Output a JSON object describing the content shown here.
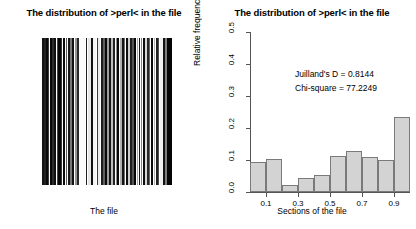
{
  "left_panel": {
    "title": "The distribution of >perl< in the file",
    "xlabel": "The file"
  },
  "right_panel": {
    "title": "The distribution of >perl< in the file",
    "annotations": {
      "juilland_d": "Juilland's D = 0.8144",
      "chi_square": "Chi-square = 77.2249"
    }
  },
  "chart_data": {
    "type": "bar",
    "title": "The distribution of >perl< in the file",
    "xlabel": "Sections of the file",
    "ylabel": "Relative frequencies of 'perl'",
    "categories": [
      "0.05",
      "0.15",
      "0.25",
      "0.35",
      "0.45",
      "0.55",
      "0.65",
      "0.75",
      "0.85",
      "0.95"
    ],
    "values": [
      0.093,
      0.102,
      0.022,
      0.045,
      0.054,
      0.113,
      0.128,
      0.108,
      0.101,
      0.235
    ],
    "bin_edges": [
      0.0,
      0.1,
      0.2,
      0.3,
      0.4,
      0.5,
      0.6,
      0.7,
      0.8,
      0.9,
      1.0
    ],
    "xlim": [
      0.0,
      1.0
    ],
    "ylim": [
      0.0,
      0.5
    ],
    "xticks": [
      "0.1",
      "0.3",
      "0.5",
      "0.7",
      "0.9"
    ],
    "xtick_values": [
      0.1,
      0.3,
      0.5,
      0.7,
      0.9
    ],
    "yticks": [
      "0.0",
      "0.1",
      "0.2",
      "0.3",
      "0.4",
      "0.5"
    ],
    "ytick_values": [
      0.0,
      0.1,
      0.2,
      0.3,
      0.4,
      0.5
    ],
    "grid": false,
    "legend": "none",
    "bar_fill": "#d3d3d3",
    "bar_stroke": "#7a7a7a"
  },
  "barcode_data": {
    "type": "rug-strip",
    "description": "dispersion barcode of token positions across the file",
    "lines": [
      {
        "pos": 0.5,
        "w": 2.0,
        "v": 20
      },
      {
        "pos": 2.0,
        "w": 1.6,
        "v": 35
      },
      {
        "pos": 3.6,
        "w": 2.2,
        "v": 10
      },
      {
        "pos": 6.0,
        "w": 1.4,
        "v": 60
      },
      {
        "pos": 7.6,
        "w": 2.4,
        "v": 8
      },
      {
        "pos": 10.4,
        "w": 1.6,
        "v": 45
      },
      {
        "pos": 12.3,
        "w": 2.0,
        "v": 15
      },
      {
        "pos": 14.6,
        "w": 1.5,
        "v": 70
      },
      {
        "pos": 16.4,
        "w": 2.2,
        "v": 5
      },
      {
        "pos": 19.0,
        "w": 1.4,
        "v": 55
      },
      {
        "pos": 20.8,
        "w": 2.6,
        "v": 12
      },
      {
        "pos": 23.8,
        "w": 1.6,
        "v": 90
      },
      {
        "pos": 25.8,
        "w": 2.0,
        "v": 25
      },
      {
        "pos": 28.2,
        "w": 1.4,
        "v": 120
      },
      {
        "pos": 30.0,
        "w": 2.4,
        "v": 18
      },
      {
        "pos": 33.0,
        "w": 1.5,
        "v": 150
      },
      {
        "pos": 35.0,
        "w": 2.0,
        "v": 40
      },
      {
        "pos": 37.5,
        "w": 5.5,
        "v": 250
      },
      {
        "pos": 43.5,
        "w": 1.8,
        "v": 30
      },
      {
        "pos": 45.8,
        "w": 3.0,
        "v": 230
      },
      {
        "pos": 49.3,
        "w": 1.6,
        "v": 15
      },
      {
        "pos": 51.3,
        "w": 2.6,
        "v": 245
      },
      {
        "pos": 54.5,
        "w": 1.4,
        "v": 60
      },
      {
        "pos": 56.4,
        "w": 2.0,
        "v": 235
      },
      {
        "pos": 59.0,
        "w": 1.6,
        "v": 28
      },
      {
        "pos": 61.0,
        "w": 1.5,
        "v": 95
      },
      {
        "pos": 63.0,
        "w": 1.8,
        "v": 10
      },
      {
        "pos": 65.2,
        "w": 1.4,
        "v": 160
      },
      {
        "pos": 67.0,
        "w": 2.0,
        "v": 22
      },
      {
        "pos": 69.4,
        "w": 1.5,
        "v": 190
      },
      {
        "pos": 71.3,
        "w": 1.8,
        "v": 35
      },
      {
        "pos": 73.5,
        "w": 1.4,
        "v": 140
      },
      {
        "pos": 75.3,
        "w": 2.2,
        "v": 8
      },
      {
        "pos": 78.0,
        "w": 1.5,
        "v": 175
      },
      {
        "pos": 79.9,
        "w": 1.8,
        "v": 20
      },
      {
        "pos": 82.1,
        "w": 1.4,
        "v": 110
      },
      {
        "pos": 83.9,
        "w": 2.0,
        "v": 14
      },
      {
        "pos": 86.3,
        "w": 1.5,
        "v": 205
      },
      {
        "pos": 88.2,
        "w": 1.7,
        "v": 30
      },
      {
        "pos": 90.3,
        "w": 1.4,
        "v": 85
      },
      {
        "pos": 92.1,
        "w": 2.2,
        "v": 6
      },
      {
        "pos": 94.7,
        "w": 1.5,
        "v": 165
      },
      {
        "pos": 96.6,
        "w": 1.8,
        "v": 24
      },
      {
        "pos": 98.8,
        "w": 1.4,
        "v": 130
      },
      {
        "pos": 100.6,
        "w": 2.0,
        "v": 12
      },
      {
        "pos": 103.0,
        "w": 1.5,
        "v": 215
      },
      {
        "pos": 104.9,
        "w": 1.7,
        "v": 40
      },
      {
        "pos": 107.0,
        "w": 1.4,
        "v": 100
      },
      {
        "pos": 108.8,
        "w": 2.4,
        "v": 9
      },
      {
        "pos": 111.6,
        "w": 1.6,
        "v": 180
      },
      {
        "pos": 113.6,
        "w": 2.0,
        "v": 32
      },
      {
        "pos": 116.0,
        "w": 1.4,
        "v": 75
      },
      {
        "pos": 117.8,
        "w": 2.8,
        "v": 240
      },
      {
        "pos": 121.0,
        "w": 1.6,
        "v": 18
      },
      {
        "pos": 123.0,
        "w": 1.5,
        "v": 125
      },
      {
        "pos": 124.9,
        "w": 5.1,
        "v": 4
      }
    ]
  }
}
